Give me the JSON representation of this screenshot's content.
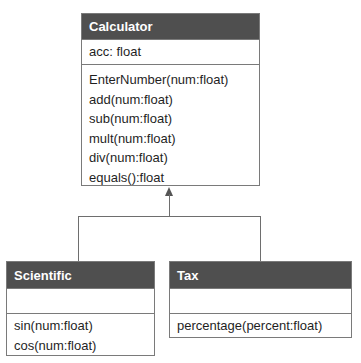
{
  "diagram": {
    "type": "uml-class-diagram",
    "classes": [
      {
        "name": "Calculator",
        "attributes": [
          "acc: float"
        ],
        "methods": [
          "EnterNumber(num:float)",
          "add(num:float)",
          "sub(num:float)",
          "mult(num:float)",
          "div(num:float)",
          "equals():float"
        ]
      },
      {
        "name": "Scientific",
        "attributes": [],
        "methods": [
          "sin(num:float)",
          "cos(num:float)"
        ]
      },
      {
        "name": "Tax",
        "attributes": [],
        "methods": [
          "percentage(percent:float)"
        ]
      }
    ],
    "relationships": [
      {
        "type": "inheritance",
        "from": "Scientific",
        "to": "Calculator"
      },
      {
        "type": "inheritance",
        "from": "Tax",
        "to": "Calculator"
      }
    ],
    "colors": {
      "header_bg": "#4f4f4f",
      "header_text": "#ffffff",
      "border": "#7a7a7a",
      "connector": "#6e6e6e"
    }
  }
}
